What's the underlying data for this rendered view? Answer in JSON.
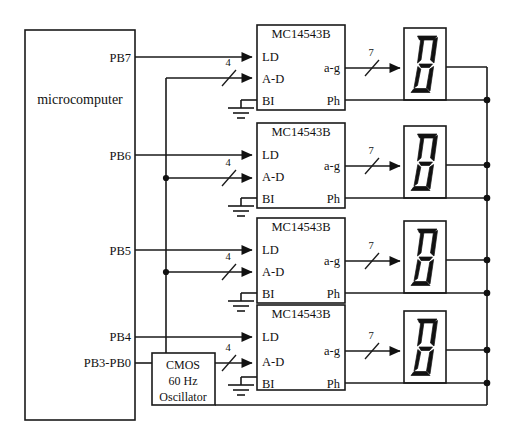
{
  "figure": {
    "domain": "Diagram",
    "kind": "electronic-schematic",
    "background": "#ffffff",
    "ink_color": "#111111"
  },
  "microcomputer": {
    "label": "microcomputer",
    "ports": [
      {
        "name": "PB7",
        "drives": "LD of digit 1"
      },
      {
        "name": "PB6",
        "drives": "LD of digit 2"
      },
      {
        "name": "PB5",
        "drives": "LD of digit 3"
      },
      {
        "name": "PB4",
        "drives": "LD of digit 4"
      },
      {
        "name": "PB3-PB0",
        "drives": "A-D bus of all digits"
      }
    ]
  },
  "decoders": [
    {
      "part": "MC14543B",
      "inputs": [
        "LD",
        "A-D",
        "BI"
      ],
      "outputs": [
        "a-g",
        "Ph"
      ],
      "bus_width_in": "4",
      "bus_width_out": "7",
      "bi_state": "grounded"
    },
    {
      "part": "MC14543B",
      "inputs": [
        "LD",
        "A-D",
        "BI"
      ],
      "outputs": [
        "a-g",
        "Ph"
      ],
      "bus_width_in": "4",
      "bus_width_out": "7",
      "bi_state": "grounded"
    },
    {
      "part": "MC14543B",
      "inputs": [
        "LD",
        "A-D",
        "BI"
      ],
      "outputs": [
        "a-g",
        "Ph"
      ],
      "bus_width_in": "4",
      "bus_width_out": "7",
      "bi_state": "grounded"
    },
    {
      "part": "MC14543B",
      "inputs": [
        "LD",
        "A-D",
        "BI"
      ],
      "outputs": [
        "a-g",
        "Ph"
      ],
      "bus_width_in": "4",
      "bus_width_out": "7",
      "bi_state": "grounded"
    }
  ],
  "displays": [
    {
      "type": "seven-segment",
      "glyph": "8"
    },
    {
      "type": "seven-segment",
      "glyph": "8"
    },
    {
      "type": "seven-segment",
      "glyph": "8"
    },
    {
      "type": "seven-segment",
      "glyph": "8"
    }
  ],
  "oscillator": {
    "line1": "CMOS",
    "line2": "60 Hz",
    "line3": "Oscillator",
    "drives": "common backplane / Ph bus"
  },
  "nets": {
    "data_bus_label": "4",
    "segment_bus_label": "7",
    "backplane": "common right-hand bus tying display commons, Ph pins and oscillator"
  }
}
